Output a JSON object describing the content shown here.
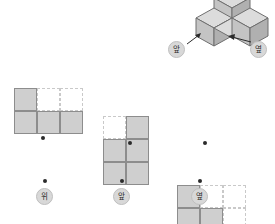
{
  "solid": {
    "name": "isometric-cube-solid",
    "cube_count": 4,
    "description": "three-dimensional shape built from unit cubes",
    "fill_top": "#d6d6d6",
    "fill_left": "#c2c2c2",
    "fill_right": "#b0b0b0",
    "stroke": "#6f6f6f"
  },
  "callouts": [
    {
      "id": "callout-front",
      "label": "앞",
      "arrow": "arrow-up-right"
    },
    {
      "id": "callout-side",
      "label": "옆",
      "arrow": "arrow-left"
    }
  ],
  "views": [
    {
      "id": "view-top",
      "label": "위",
      "cols": 3,
      "rows": 2,
      "cells": [
        [
          1,
          0,
          0
        ],
        [
          1,
          1,
          1
        ]
      ]
    },
    {
      "id": "view-front",
      "label": "앞",
      "cols": 2,
      "rows": 3,
      "cells": [
        [
          0,
          1
        ],
        [
          1,
          1
        ],
        [
          1,
          1
        ]
      ]
    },
    {
      "id": "view-side",
      "label": "옆",
      "cols": 3,
      "rows": 3,
      "cells": [
        [
          1,
          0,
          0
        ],
        [
          1,
          1,
          0
        ],
        [
          1,
          1,
          1
        ]
      ]
    }
  ],
  "labels": {
    "top": "위",
    "front": "앞",
    "side": "옆"
  },
  "colors": {
    "cell_fill": "#cfcfcf",
    "cell_stroke": "#8d8d8d",
    "empty_stroke": "#c9c9c9",
    "bubble_bg": "#d8d8d8",
    "dot": "#2b2b2b"
  }
}
